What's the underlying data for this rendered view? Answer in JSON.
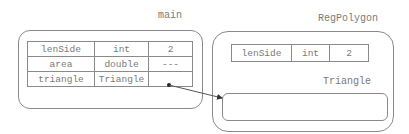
{
  "frames": {
    "main": {
      "title": "main",
      "variables": [
        {
          "name": "lenSide",
          "type": "int",
          "value": "2"
        },
        {
          "name": "area",
          "type": "double",
          "value": "---"
        },
        {
          "name": "triangle",
          "type": "Triangle",
          "value": ""
        }
      ]
    },
    "regpolygon": {
      "title": "RegPolygon",
      "variables": [
        {
          "name": "lenSide",
          "type": "int",
          "value": "2"
        }
      ],
      "inner_object_label": "Triangle"
    }
  },
  "reference": {
    "from": "main.triangle",
    "to": "regpolygon.Triangle",
    "icon": "arrow-icon"
  }
}
